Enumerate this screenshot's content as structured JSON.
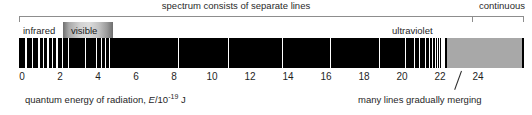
{
  "figure": {
    "title_left": "spectrum consists of separate lines",
    "title_right": "continuous",
    "bands": {
      "infrared": "infrared",
      "visible": "visible",
      "ultraviolet": "ultraviolet"
    },
    "axis": {
      "caption_prefix": "quantum energy of radiation, ",
      "caption_symbol": "E",
      "caption_unit": "/10",
      "caption_exponent": "-19",
      "caption_suffix": " J",
      "caption_full": "quantum energy of radiation, E/10-19 J",
      "ticks": [
        0,
        2,
        4,
        6,
        8,
        10,
        12,
        14,
        16,
        18,
        20,
        22,
        24
      ],
      "range": [
        0,
        26.5
      ],
      "units": "10^-19 J"
    },
    "annotations": {
      "merging": "many lines gradually merging"
    },
    "colors": {
      "bar_background": "#000000",
      "line": "#ffffff",
      "continuum": "#a8a8a8",
      "rule": "#8d8d8d",
      "text": "#1f1f1f"
    }
  },
  "chart_data": {
    "type": "line-spectrum",
    "title": "spectrum consists of separate lines",
    "xlabel": "quantum energy of radiation, E/10-19 J",
    "ylabel": "",
    "xlim": [
      0,
      26.5
    ],
    "grid": false,
    "legend": "none",
    "series": [
      {
        "name": "emission lines",
        "note": "vertical white lines on black background; x values in units of 10^-19 J",
        "x": [
          0.35,
          0.72,
          1.05,
          1.3,
          1.52,
          1.74,
          2.0,
          2.3,
          2.62,
          3.48,
          4.1,
          4.32,
          4.55,
          4.78,
          8.4,
          11.05,
          13.85,
          16.4,
          18.95,
          20.35,
          20.8,
          21.1,
          21.38,
          21.6,
          21.78,
          21.92,
          22.04,
          22.14,
          22.22,
          22.29,
          22.35,
          22.4
        ],
        "widths": [
          2,
          1,
          2,
          1,
          2,
          1,
          2,
          1,
          1,
          1,
          1,
          1,
          1,
          1,
          1,
          1,
          1,
          1,
          1,
          1,
          1,
          1,
          1,
          1,
          1,
          1,
          1,
          1,
          1,
          1,
          1,
          1
        ]
      },
      {
        "name": "continuum",
        "note": "solid grey block where lines have merged",
        "x_start": 22.55,
        "x_end": 26.5,
        "color": "#a8a8a8"
      }
    ],
    "regions": [
      {
        "label": "infrared",
        "x_start": 0.0,
        "x_end": 2.3
      },
      {
        "label": "visible",
        "x_start": 2.3,
        "x_end": 4.9
      },
      {
        "label": "ultraviolet",
        "x_start": 4.9,
        "x_end": 22.5
      }
    ],
    "annotations": [
      {
        "text": "spectrum consists of separate lines",
        "position": "top-center"
      },
      {
        "text": "continuous",
        "position": "top-right"
      },
      {
        "text": "many lines gradually merging",
        "position": "bottom-right",
        "points_to_x": 21.8
      }
    ]
  }
}
